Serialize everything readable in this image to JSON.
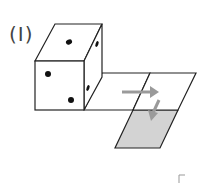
{
  "figure": {
    "label": "(I)",
    "colors": {
      "line": "#222222",
      "arrow": "#9a9a9a",
      "shade": "#d3d3d3",
      "dot": "#111111"
    },
    "cube": {
      "top_face_dots": 1,
      "front_face_dots": 2,
      "right_face_dots": 2
    },
    "net": {
      "faces": 3,
      "shaded_face": "bottom"
    },
    "arrows": [
      "right-arrow",
      "down-arrow"
    ]
  }
}
